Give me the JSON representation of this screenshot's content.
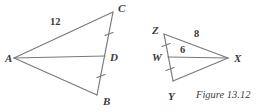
{
  "figure": {
    "caption": "Figure 13.12",
    "stroke_color": "#7a7a7a",
    "text_color": "#3a3a3a",
    "background_color": "#ffffff"
  },
  "left_diagram": {
    "name": "triangle-abc-with-median",
    "vertices": [
      {
        "label": "A",
        "x": 14,
        "y": 58,
        "label_x": 5,
        "label_y": 53
      },
      {
        "label": "C",
        "x": 113,
        "y": 12,
        "label_x": 118,
        "label_y": 3
      },
      {
        "label": "B",
        "x": 97,
        "y": 95,
        "label_x": 103,
        "label_y": 96
      },
      {
        "label": "D",
        "x": 105,
        "y": 56,
        "label_x": 110,
        "label_y": 52
      }
    ],
    "segments": [
      {
        "name": "segment-AC",
        "from": "A",
        "to": "C"
      },
      {
        "name": "segment-AB",
        "from": "A",
        "to": "B"
      },
      {
        "name": "segment-CB",
        "from": "C",
        "to": "B"
      },
      {
        "name": "median-AD",
        "from": "A",
        "to": "D"
      }
    ],
    "measures": [
      {
        "name": "length-AC",
        "value": "12",
        "x": 50,
        "y": 17
      }
    ],
    "tick_marks": [
      {
        "name": "tick-CD",
        "x": 109,
        "y": 34
      },
      {
        "name": "tick-DB",
        "x": 101,
        "y": 76
      }
    ]
  },
  "right_diagram": {
    "name": "triangle-zyx-with-median",
    "vertices": [
      {
        "label": "Z",
        "x": 164,
        "y": 34,
        "label_x": 152,
        "label_y": 25
      },
      {
        "label": "X",
        "x": 228,
        "y": 58,
        "label_x": 234,
        "label_y": 53
      },
      {
        "label": "Y",
        "x": 173,
        "y": 81,
        "label_x": 168,
        "label_y": 91
      },
      {
        "label": "W",
        "x": 168,
        "y": 57,
        "label_x": 152,
        "label_y": 52
      }
    ],
    "segments": [
      {
        "name": "segment-ZX",
        "from": "Z",
        "to": "X"
      },
      {
        "name": "segment-ZY",
        "from": "Z",
        "to": "Y"
      },
      {
        "name": "segment-YX",
        "from": "Y",
        "to": "X"
      },
      {
        "name": "median-WX",
        "from": "W",
        "to": "X"
      }
    ],
    "measures": [
      {
        "name": "length-ZX",
        "value": "8",
        "x": 194,
        "y": 29
      },
      {
        "name": "length-WX",
        "value": "6",
        "x": 180,
        "y": 45
      }
    ],
    "tick_marks": [
      {
        "name": "tick-ZW",
        "x": 166,
        "y": 45
      },
      {
        "name": "tick-WY",
        "x": 170,
        "y": 69
      }
    ]
  },
  "caption_block": {
    "text": "Figure 13.12",
    "x": 196,
    "y": 90
  }
}
